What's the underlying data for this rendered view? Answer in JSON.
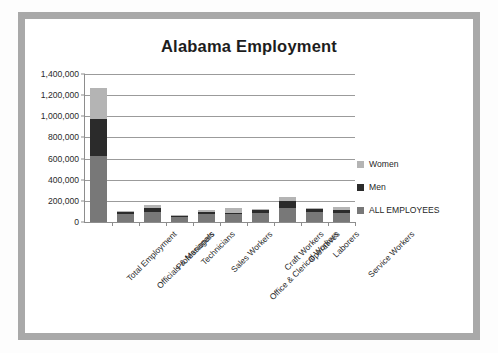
{
  "chart_data": {
    "type": "bar",
    "subtype": "stacked-column",
    "title": "Alabama Employment",
    "xlabel": "",
    "ylabel": "",
    "ylim": [
      0,
      1400000
    ],
    "ytick_labels": [
      "1,400,000",
      "1,200,000",
      "1,000,000",
      "800,000",
      "600,000",
      "400,000",
      "200,000",
      "0"
    ],
    "ytick_values": [
      1400000,
      1200000,
      1000000,
      800000,
      600000,
      400000,
      200000,
      0
    ],
    "grid": true,
    "legend_position": "right",
    "categories": [
      "Total Employment",
      "Officials & Managers",
      "Professionals",
      "Technicians",
      "Sales Workers",
      "Office & Clerical Workers",
      "Craft Workers",
      "Operatives",
      "Laborers",
      "Service Workers"
    ],
    "series": [
      {
        "name": "ALL EMPLOYEES",
        "color": "#787878",
        "values": [
          620000,
          75000,
          95000,
          50000,
          80000,
          75000,
          90000,
          130000,
          95000,
          85000
        ]
      },
      {
        "name": "Men",
        "color": "#2b2b2b",
        "values": [
          355000,
          25000,
          35000,
          12000,
          15000,
          10000,
          30000,
          65000,
          25000,
          25000
        ]
      },
      {
        "name": "Women",
        "color": "#b4b4b4",
        "values": [
          290000,
          8000,
          28000,
          6000,
          15000,
          45000,
          5000,
          45000,
          10000,
          35000
        ]
      }
    ],
    "totals": [
      1265000,
      108000,
      158000,
      68000,
      110000,
      130000,
      125000,
      240000,
      130000,
      145000
    ]
  },
  "legend": {
    "items": [
      {
        "label": "Women",
        "color": "#b4b4b4"
      },
      {
        "label": "Men",
        "color": "#2b2b2b"
      },
      {
        "label": "ALL EMPLOYEES",
        "color": "#787878"
      }
    ]
  },
  "colors": {
    "frame": "#a9a9a9",
    "gridline": "#9b9b9b",
    "axis": "#8d8d8d",
    "background": "#ffffff",
    "text": "#1d1d1d"
  }
}
